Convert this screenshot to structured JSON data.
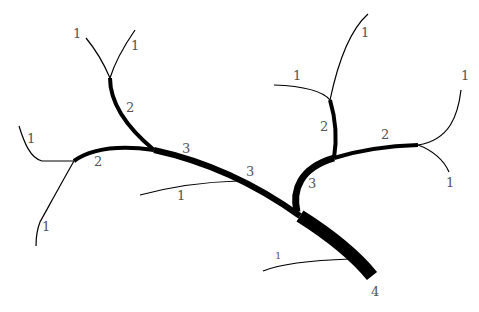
{
  "diagram": {
    "type": "stream-order-tree",
    "stroke_color": "#000000",
    "label_color": "#555555",
    "order_labels": {
      "l1_top_left_a": "1",
      "l1_top_left_b": "1",
      "l2_upper_left": "2",
      "l3_upper_mid": "3",
      "l1_left_upper": "1",
      "l2_left": "2",
      "l1_left_lower": "1",
      "l3_mid": "3",
      "l1_mid_lower": "1",
      "l1_top_right_a": "1",
      "l1_right_upper": "1",
      "l2_right_vertical": "2",
      "l2_right_horizontal": "2",
      "l1_far_right_upper": "1",
      "l1_far_right_lower": "1",
      "l3_right": "3",
      "l1_bottom": "1",
      "l4_outlet": "4"
    }
  }
}
